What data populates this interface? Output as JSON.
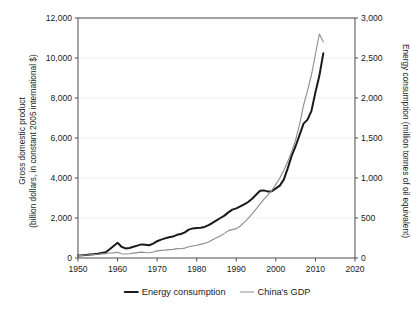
{
  "chart_data": {
    "type": "line",
    "title": "",
    "xlabel": "",
    "ylabel": "Gross domestic product\n(billion dollars, in constant 2005 international $)",
    "y2label": "Energy consumption (million tonnes of oil equivalent)",
    "grid": true,
    "legend_position": "bottom",
    "xlim": [
      1950,
      2020
    ],
    "ylim": [
      0,
      12000
    ],
    "y2lim": [
      0,
      3000
    ],
    "xticks": [
      1950,
      1960,
      1970,
      1980,
      1990,
      2000,
      2010,
      2020
    ],
    "xtick_labels": [
      "1950",
      "1960",
      "1970",
      "1980",
      "1990",
      "2000",
      "2010",
      "2020"
    ],
    "yticks": [
      0,
      2000,
      4000,
      6000,
      8000,
      10000,
      12000
    ],
    "ytick_labels": [
      "0",
      "2,000",
      "4,000",
      "6,000",
      "8,000",
      "10,000",
      "12,000"
    ],
    "y2ticks": [
      0,
      500,
      1000,
      1500,
      2000,
      2500,
      3000
    ],
    "y2tick_labels": [
      "0",
      "500",
      "1,000",
      "1,500",
      "2,000",
      "2,500",
      "3,000"
    ],
    "axis_titles": {
      "left_line1": "Gross domestic product",
      "left_line2": "(billion dollars, in constant 2005 international $)",
      "right": "Energy consumption (million tonnes of oil equivalent)"
    },
    "series": [
      {
        "name": "Energy consumption",
        "axis": "right",
        "units": "million tonnes of oil equivalent",
        "color": "#1a1a1a",
        "line_width": 2.0,
        "x": [
          1950,
          1951,
          1952,
          1953,
          1954,
          1955,
          1956,
          1957,
          1958,
          1959,
          1960,
          1961,
          1962,
          1963,
          1964,
          1965,
          1966,
          1967,
          1968,
          1969,
          1970,
          1971,
          1972,
          1973,
          1974,
          1975,
          1976,
          1977,
          1978,
          1979,
          1980,
          1981,
          1982,
          1983,
          1984,
          1985,
          1986,
          1987,
          1988,
          1989,
          1990,
          1991,
          1992,
          1993,
          1994,
          1995,
          1996,
          1997,
          1998,
          1999,
          2000,
          2001,
          2002,
          2003,
          2004,
          2005,
          2006,
          2007,
          2008,
          2009,
          2010,
          2011,
          2012
        ],
        "values": [
          30,
          33,
          38,
          44,
          48,
          52,
          62,
          72,
          110,
          150,
          190,
          140,
          120,
          125,
          140,
          155,
          170,
          165,
          160,
          180,
          210,
          230,
          245,
          260,
          268,
          290,
          300,
          320,
          355,
          370,
          375,
          378,
          388,
          410,
          440,
          470,
          500,
          530,
          570,
          605,
          620,
          645,
          670,
          700,
          740,
          790,
          840,
          845,
          830,
          835,
          870,
          905,
          980,
          1120,
          1280,
          1400,
          1540,
          1680,
          1730,
          1840,
          2070,
          2280,
          2560
        ],
        "end_label_value": 2560
      },
      {
        "name": "China's GDP",
        "axis": "left",
        "units": "billion dollars, constant 2005 international $",
        "color": "#8c8c8c",
        "line_width": 1.1,
        "x": [
          1950,
          1951,
          1952,
          1953,
          1954,
          1955,
          1956,
          1957,
          1958,
          1959,
          1960,
          1961,
          1962,
          1963,
          1964,
          1965,
          1966,
          1967,
          1968,
          1969,
          1970,
          1971,
          1972,
          1973,
          1974,
          1975,
          1976,
          1977,
          1978,
          1979,
          1980,
          1981,
          1982,
          1983,
          1984,
          1985,
          1986,
          1987,
          1988,
          1989,
          1990,
          1991,
          1992,
          1993,
          1994,
          1995,
          1996,
          1997,
          1998,
          1999,
          2000,
          2001,
          2002,
          2003,
          2004,
          2005,
          2006,
          2007,
          2008,
          2009,
          2010,
          2011,
          2012
        ],
        "values": [
          120,
          130,
          150,
          165,
          175,
          185,
          205,
          215,
          250,
          255,
          290,
          215,
          200,
          215,
          245,
          270,
          295,
          275,
          265,
          300,
          355,
          380,
          395,
          420,
          430,
          470,
          460,
          495,
          560,
          600,
          640,
          680,
          735,
          805,
          910,
          1010,
          1100,
          1230,
          1370,
          1420,
          1470,
          1600,
          1780,
          1980,
          2210,
          2440,
          2690,
          2940,
          3160,
          3390,
          3680,
          4000,
          4380,
          4820,
          5320,
          5920,
          6680,
          7640,
          8370,
          9150,
          10200,
          11200,
          10800
        ],
        "end_label_value": 10800
      }
    ],
    "annotations": []
  },
  "legend": {
    "items": [
      {
        "label": "Energy consumption",
        "color": "#1a1a1a",
        "width": 2.0
      },
      {
        "label": "China's GDP",
        "color": "#8c8c8c",
        "width": 1.1
      }
    ]
  },
  "colors": {
    "axis": "#4d4d4d",
    "grid": "#f0f0f0",
    "text": "#1a1a1a",
    "background": "#ffffff"
  }
}
